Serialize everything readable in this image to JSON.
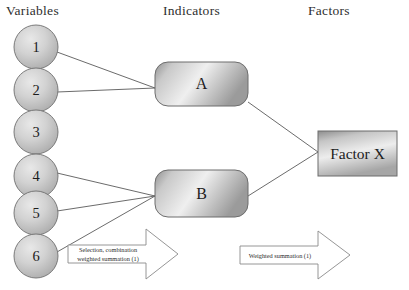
{
  "diagram": {
    "columns": [
      {
        "id": "variables",
        "label": "Variables"
      },
      {
        "id": "indicators",
        "label": "Indicators"
      },
      {
        "id": "factors",
        "label": "Factors"
      }
    ],
    "variables": [
      {
        "id": "v1",
        "label": "1",
        "cx": 36,
        "cy": 47,
        "r": 22
      },
      {
        "id": "v2",
        "label": "2",
        "cx": 36,
        "cy": 90,
        "r": 22
      },
      {
        "id": "v3",
        "label": "3",
        "cx": 36,
        "cy": 132,
        "r": 22
      },
      {
        "id": "v4",
        "label": "4",
        "cx": 36,
        "cy": 176,
        "r": 22
      },
      {
        "id": "v5",
        "label": "5",
        "cx": 36,
        "cy": 213,
        "r": 22
      },
      {
        "id": "v6",
        "label": "6",
        "cx": 36,
        "cy": 256,
        "r": 22
      }
    ],
    "indicators": [
      {
        "id": "indicator-a",
        "label": "A",
        "x": 155,
        "y": 62,
        "w": 93,
        "h": 44,
        "rx": 13
      },
      {
        "id": "indicator-b",
        "label": "B",
        "x": 155,
        "y": 170,
        "w": 93,
        "h": 47,
        "rx": 13
      }
    ],
    "factors": [
      {
        "id": "factor-x",
        "label": "Factor X",
        "x": 318,
        "y": 131,
        "w": 79,
        "h": 45
      }
    ],
    "connections": [
      {
        "from": "v1",
        "to": "indicator-a",
        "x1": 57,
        "y1": 52,
        "x2": 155,
        "y2": 88
      },
      {
        "from": "v2",
        "to": "indicator-a",
        "x1": 57,
        "y1": 92,
        "x2": 155,
        "y2": 88
      },
      {
        "from": "v4",
        "to": "indicator-b",
        "x1": 57,
        "y1": 173,
        "x2": 155,
        "y2": 196
      },
      {
        "from": "v5",
        "to": "indicator-b",
        "x1": 57,
        "y1": 211,
        "x2": 155,
        "y2": 196
      },
      {
        "from": "v6",
        "to": "indicator-b",
        "x1": 57,
        "y1": 252,
        "x2": 155,
        "y2": 196
      },
      {
        "from": "indicator-a",
        "to": "factor-x",
        "x1": 248,
        "y1": 102,
        "x2": 318,
        "y2": 152
      },
      {
        "from": "indicator-b",
        "to": "factor-x",
        "x1": 248,
        "y1": 196,
        "x2": 318,
        "y2": 152
      }
    ],
    "process_arrows": [
      {
        "id": "arrow-selection-combination",
        "line1": "Selection, combination",
        "line2": "weighted summation (1)",
        "x": 68,
        "y": 229,
        "w": 110,
        "h": 50
      },
      {
        "id": "arrow-weighted-summation",
        "line1": "Weighted summation (1)",
        "line2": "",
        "x": 240,
        "y": 231,
        "w": 110,
        "h": 48
      }
    ],
    "colors": {
      "background": "#ffffff",
      "shape_fill_light": "#f2f2f2",
      "shape_fill_mid": "#c3c3c3",
      "shape_fill_dark": "#9a9a9a",
      "stroke": "#6d6d6d",
      "connector": "#5a5a5a",
      "text": "#1c1c1c",
      "arrow_stroke": "#808080"
    }
  }
}
